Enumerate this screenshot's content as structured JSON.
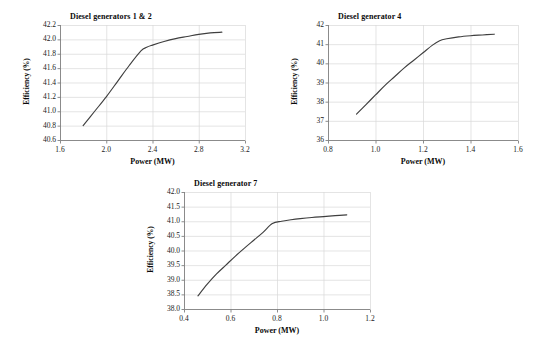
{
  "page": {
    "background_color": "#ffffff",
    "line_color": "#3f3f3f",
    "grid_color": "#d9d9d9",
    "axis_color": "#808080"
  },
  "chart_data": [
    {
      "id": "chart-1",
      "type": "line",
      "title": "Diesel generators 1 & 2",
      "xlabel": "Power (MW)",
      "ylabel": "Efficiency (%)",
      "xlim": [
        1.6,
        3.2
      ],
      "ylim": [
        40.6,
        42.2
      ],
      "xticks": [
        "1.6",
        "2.0",
        "2.4",
        "2.8",
        "3.2"
      ],
      "xtick_values": [
        1.6,
        2.0,
        2.4,
        2.8,
        3.2
      ],
      "yticks": [
        "40.6",
        "40.8",
        "41.0",
        "41.2",
        "41.4",
        "41.6",
        "41.8",
        "42.0",
        "42.2"
      ],
      "ytick_values": [
        40.6,
        40.8,
        41.0,
        41.2,
        41.4,
        41.6,
        41.8,
        42.0,
        42.2
      ],
      "grid": true,
      "legend": "none",
      "x": [
        1.8,
        1.9,
        2.0,
        2.1,
        2.2,
        2.3,
        2.35,
        2.4,
        2.5,
        2.6,
        2.7,
        2.8,
        2.9,
        3.0
      ],
      "y": [
        40.8,
        41.0,
        41.2,
        41.42,
        41.64,
        41.84,
        41.89,
        41.92,
        41.97,
        42.01,
        42.04,
        42.07,
        42.09,
        42.1
      ]
    },
    {
      "id": "chart-2",
      "type": "line",
      "title": "Diesel generator 4",
      "xlabel": "Power (MW)",
      "ylabel": "Efficiency (%)",
      "xlim": [
        0.8,
        1.6
      ],
      "ylim": [
        36,
        42
      ],
      "xticks": [
        "0.8",
        "1.0",
        "1.2",
        "1.4",
        "1.6"
      ],
      "xtick_values": [
        0.8,
        1.0,
        1.2,
        1.4,
        1.6
      ],
      "yticks": [
        "36",
        "37",
        "38",
        "39",
        "40",
        "41",
        "42"
      ],
      "ytick_values": [
        36,
        37,
        38,
        39,
        40,
        41,
        42
      ],
      "grid": true,
      "legend": "none",
      "x": [
        0.92,
        0.96,
        1.0,
        1.04,
        1.08,
        1.12,
        1.16,
        1.2,
        1.24,
        1.27,
        1.3,
        1.35,
        1.4,
        1.45,
        1.5
      ],
      "y": [
        37.35,
        37.85,
        38.35,
        38.85,
        39.3,
        39.75,
        40.15,
        40.55,
        40.95,
        41.18,
        41.28,
        41.38,
        41.44,
        41.48,
        41.52
      ]
    },
    {
      "id": "chart-3",
      "type": "line",
      "title": "Diesel generator 7",
      "xlabel": "Power (MW)",
      "ylabel": "Efficiency (%)",
      "xlim": [
        0.4,
        1.2
      ],
      "ylim": [
        38.0,
        42.0
      ],
      "xticks": [
        "0.4",
        "0.6",
        "0.8",
        "1.0",
        "1.2"
      ],
      "xtick_values": [
        0.4,
        0.6,
        0.8,
        1.0,
        1.2
      ],
      "yticks": [
        "38.0",
        "38.5",
        "39.0",
        "39.5",
        "40.0",
        "40.5",
        "41.0",
        "41.5",
        "42.0"
      ],
      "ytick_values": [
        38.0,
        38.5,
        39.0,
        39.5,
        40.0,
        40.5,
        41.0,
        41.5,
        42.0
      ],
      "grid": true,
      "legend": "none",
      "x": [
        0.46,
        0.5,
        0.54,
        0.58,
        0.62,
        0.66,
        0.7,
        0.74,
        0.78,
        0.82,
        0.86,
        0.9,
        0.95,
        1.0,
        1.05,
        1.1
      ],
      "y": [
        38.45,
        38.85,
        39.2,
        39.5,
        39.8,
        40.08,
        40.35,
        40.62,
        40.92,
        41.0,
        41.05,
        41.09,
        41.13,
        41.16,
        41.19,
        41.22
      ]
    }
  ]
}
